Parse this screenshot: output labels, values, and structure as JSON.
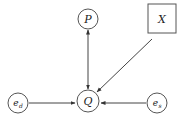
{
  "diagram": {
    "type": "causal-graph",
    "nodes": [
      {
        "id": "P",
        "label": "P",
        "shape": "circle",
        "cx": 88,
        "cy": 19,
        "r": 10
      },
      {
        "id": "X",
        "label": "X",
        "shape": "square",
        "x": 148,
        "y": 4,
        "w": 28,
        "h": 29
      },
      {
        "id": "Q",
        "label": "Q",
        "shape": "circle",
        "cx": 88,
        "cy": 101,
        "r": 11
      },
      {
        "id": "ed",
        "label": "e",
        "sub": "d",
        "shape": "circle",
        "cx": 18,
        "cy": 103,
        "r": 10
      },
      {
        "id": "es",
        "label": "e",
        "sub": "s",
        "shape": "circle",
        "cx": 157,
        "cy": 103,
        "r": 10
      }
    ],
    "edges": [
      {
        "from": "P",
        "to": "Q",
        "bidirectional": true
      },
      {
        "from": "X",
        "to": "Q",
        "bidirectional": false
      },
      {
        "from": "ed",
        "to": "Q",
        "bidirectional": false
      },
      {
        "from": "es",
        "to": "Q",
        "bidirectional": false
      }
    ],
    "colors": {
      "stroke": "#555555",
      "text": "#222222",
      "background": "#ffffff"
    }
  }
}
